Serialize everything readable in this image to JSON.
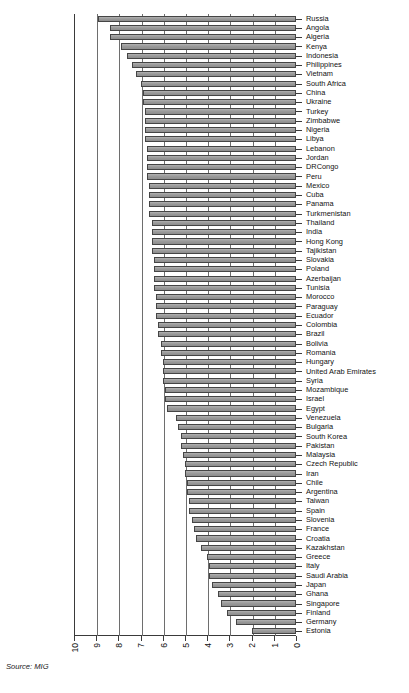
{
  "source": {
    "text": "Source: MIG"
  },
  "axis": {
    "x_ticks": [
      "10",
      "9",
      "8",
      "7",
      "6",
      "5",
      "4",
      "3",
      "2",
      "1",
      "0"
    ],
    "reversed": true
  },
  "style": {
    "bar_fill": "#9d9d9d",
    "bar_stroke": "#454545",
    "axis_color": "#3a3a3a",
    "grid_color": "#6e6e6e",
    "background": "#ffffff"
  },
  "chart_data": {
    "type": "bar",
    "orientation": "horizontal",
    "title": "",
    "subtitle": "",
    "xlabel": "",
    "ylabel": "",
    "xlim": [
      10,
      0
    ],
    "axis_reversed": true,
    "grid": true,
    "legend": false,
    "legend_position": "none",
    "source": "Source: MIG",
    "categories": [
      "Russia",
      "Angola",
      "Algeria",
      "Kenya",
      "Indonesia",
      "Philippines",
      "Vietnam",
      "South Africa",
      "China",
      "Ukraine",
      "Turkey",
      "Zimbabwe",
      "Nigeria",
      "Libya",
      "Lebanon",
      "Jordan",
      "DRCongo",
      "Peru",
      "Mexico",
      "Cuba",
      "Panama",
      "Turkmenistan",
      "Thailand",
      "India",
      "Hong Kong",
      "Tajikistan",
      "Slovakia",
      "Poland",
      "Azerbaijan",
      "Tunisia",
      "Morocco",
      "Paraguay",
      "Ecuador",
      "Colombia",
      "Brazil",
      "Bolivia",
      "Romania",
      "Hungary",
      "United Arab Emirates",
      "Syria",
      "Mozambique",
      "Israel",
      "Egypt",
      "Venezuela",
      "Bulgaria",
      "South Korea",
      "Pakistan",
      "Malaysia",
      "Czech Republic",
      "Iran",
      "Chile",
      "Argentina",
      "Taiwan",
      "Spain",
      "Slovenia",
      "France",
      "Croatia",
      "Kazakhstan",
      "Greece",
      "Italy",
      "Saudi Arabia",
      "Japan",
      "Ghana",
      "Singapore",
      "Finland",
      "Germany",
      "Estonia"
    ],
    "values": [
      8.9,
      8.4,
      8.4,
      7.9,
      7.6,
      7.4,
      7.2,
      7.0,
      6.9,
      6.9,
      6.8,
      6.8,
      6.8,
      6.8,
      6.7,
      6.7,
      6.7,
      6.7,
      6.6,
      6.6,
      6.6,
      6.6,
      6.5,
      6.5,
      6.5,
      6.5,
      6.4,
      6.4,
      6.4,
      6.4,
      6.3,
      6.3,
      6.3,
      6.2,
      6.2,
      6.1,
      6.1,
      6.0,
      6.0,
      6.0,
      5.9,
      5.9,
      5.8,
      5.4,
      5.3,
      5.2,
      5.2,
      5.1,
      5.0,
      5.0,
      4.9,
      4.9,
      4.8,
      4.8,
      4.7,
      4.6,
      4.5,
      4.3,
      4.0,
      3.9,
      3.9,
      3.8,
      3.5,
      3.4,
      3.1,
      2.7,
      2.0
    ]
  }
}
